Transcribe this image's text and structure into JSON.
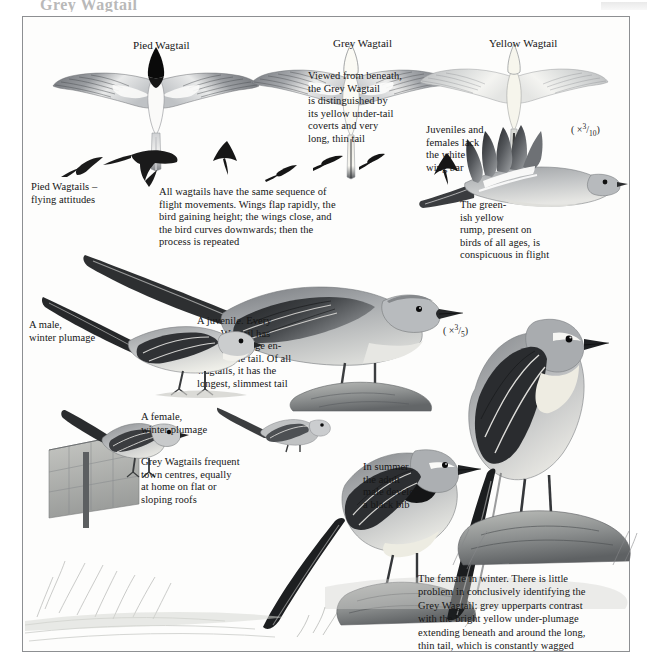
{
  "page": {
    "title_remnant": "Grey Wagtail",
    "background": "#ffffff",
    "plate_border_color": "#8d8f92"
  },
  "labels": {
    "pied_wagtail": "Pied Wagtail",
    "grey_wagtail": "Grey Wagtail",
    "yellow_wagtail": "Yellow Wagtail"
  },
  "captions": {
    "underside": "Viewed from beneath,\nthe Grey Wagtail\nis distinguished by\nits yellow under-tail\ncoverts and very\nlong, thin tail",
    "flying_attitudes": "Pied Wagtails –\nflying attitudes",
    "flight_sequence": "All wagtails have the same sequence of\nflight movements. Wings flap rapidly, the\nbird gaining height; the wings close, and\nthe bird curves downwards; then the\nprocess is repeated",
    "wing_bar": "Juveniles and\nfemales lack\nthe white\nwing bar",
    "rump": "The green-\nish yellow\nrump, present on\nbirds of all ages, is\nconspicuous in flight",
    "juvenile": "A juvenile. Every\nGrey Wagtail has\nyellow plumage en-\ncircling the tail. Of all\nwagtails, it has the\nlongest, slimmest tail",
    "male_winter": "A male,\nwinter plumage",
    "female_winter": "A female,\nwinter plumage",
    "town_centres": "Grey Wagtails frequent\ntown centres, equally\nat home on flat or\nsloping roofs",
    "summer_bib": "In summer\nthe adult\nmale develops\na black bib",
    "female_winter_long": "The female in winter. There is little\nproblem in conclusively identifying the\nGrey Wagtail: grey upperparts contrast\nwith the bright yellow under-plumage\nextending beneath and around the long,\nthin tail, which is constantly wagged"
  },
  "scales": {
    "upper_right": "( × 3/10 )",
    "middle": "( × 3/5 )",
    "upper_right_parts": {
      "open": "( ×",
      "num": "3",
      "den": "10",
      "close": ")"
    },
    "middle_parts": {
      "open": "( ×",
      "num": "3",
      "den": "5",
      "close": ")"
    }
  },
  "figures": {
    "pied_underside": "pied-wagtail-underside-illustration",
    "grey_underside": "grey-wagtail-underside-illustration",
    "yellow_underside": "yellow-wagtail-underside-illustration",
    "flight_silhouettes": "pied-wagtail-flight-silhouettes",
    "flying_grey": "grey-wagtail-in-flight-illustration",
    "perched_juvenile": "grey-wagtail-juvenile-on-rock",
    "male_winter_perched": "grey-wagtail-male-winter-perched",
    "female_winter_perched": "grey-wagtail-female-winter-on-roof",
    "summer_male": "grey-wagtail-summer-male-on-rock",
    "female_winter_standing": "grey-wagtail-female-winter-standing"
  }
}
